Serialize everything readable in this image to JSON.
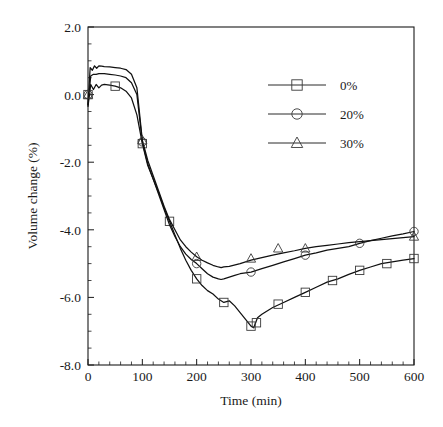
{
  "chart_data": {
    "type": "line",
    "title": "",
    "xlabel": "Time (min)",
    "ylabel": "Volume change (%)",
    "xlim": [
      0,
      600
    ],
    "ylim": [
      -8.0,
      2.0
    ],
    "xticks": [
      0,
      100,
      200,
      300,
      400,
      500,
      600
    ],
    "xtick_labels": [
      "0",
      "100",
      "200",
      "300",
      "400",
      "500",
      "600"
    ],
    "yticks": [
      2.0,
      0.0,
      -2.0,
      -4.0,
      -6.0,
      -8.0
    ],
    "ytick_labels": [
      "2.0",
      "0.0",
      "-2.0",
      "-4.0",
      "-6.0",
      "-8.0"
    ],
    "minor_ticks_x": 5,
    "minor_ticks_y": 4,
    "grid": false,
    "legend_position": "upper-right-inside",
    "series": [
      {
        "name": "0%",
        "marker": "square",
        "marker_x": [
          0,
          50,
          100,
          150,
          200,
          250,
          300,
          310,
          350,
          400,
          450,
          500,
          550,
          600
        ],
        "values_at_markers": [
          0.0,
          0.25,
          -1.45,
          -3.75,
          -5.45,
          -6.15,
          -6.85,
          -6.75,
          -6.2,
          -5.85,
          -5.5,
          -5.2,
          -5.0,
          -4.85
        ],
        "x": [
          0,
          5,
          10,
          15,
          20,
          25,
          30,
          40,
          50,
          60,
          70,
          80,
          90,
          100,
          110,
          120,
          130,
          140,
          150,
          160,
          170,
          180,
          190,
          200,
          210,
          220,
          230,
          240,
          250,
          260,
          270,
          280,
          290,
          300,
          305,
          312,
          320,
          340,
          360,
          380,
          400,
          420,
          440,
          460,
          480,
          500,
          520,
          540,
          560,
          580,
          600
        ],
        "y": [
          -0.35,
          0.3,
          0.15,
          0.3,
          0.2,
          0.28,
          0.3,
          0.28,
          0.25,
          0.2,
          0.1,
          -0.1,
          -0.6,
          -1.45,
          -2.1,
          -2.5,
          -2.9,
          -3.35,
          -3.75,
          -4.15,
          -4.55,
          -4.9,
          -5.2,
          -5.45,
          -5.65,
          -5.8,
          -5.9,
          -6.05,
          -6.15,
          -6.1,
          -6.25,
          -6.45,
          -6.65,
          -6.85,
          -6.9,
          -6.6,
          -6.5,
          -6.3,
          -6.15,
          -6.0,
          -5.85,
          -5.7,
          -5.55,
          -5.45,
          -5.32,
          -5.2,
          -5.1,
          -5.0,
          -4.95,
          -4.9,
          -4.85
        ]
      },
      {
        "name": "20%",
        "marker": "circle",
        "marker_x": [
          0,
          100,
          200,
          300,
          400,
          500,
          600
        ],
        "values_at_markers": [
          0.0,
          -1.4,
          -5.0,
          -5.25,
          -4.75,
          -4.4,
          -4.05
        ],
        "x": [
          0,
          5,
          10,
          15,
          20,
          30,
          40,
          50,
          60,
          70,
          80,
          90,
          100,
          110,
          120,
          130,
          140,
          150,
          160,
          170,
          180,
          190,
          200,
          210,
          220,
          230,
          240,
          245,
          250,
          260,
          270,
          280,
          300,
          320,
          340,
          360,
          380,
          400,
          420,
          440,
          460,
          480,
          500,
          520,
          540,
          560,
          580,
          600
        ],
        "y": [
          -0.3,
          0.55,
          0.6,
          0.6,
          0.62,
          0.62,
          0.6,
          0.58,
          0.55,
          0.5,
          0.35,
          0.0,
          -1.4,
          -2.05,
          -2.5,
          -2.95,
          -3.4,
          -3.85,
          -4.2,
          -4.5,
          -4.72,
          -4.88,
          -5.0,
          -5.15,
          -5.3,
          -5.4,
          -5.45,
          -5.47,
          -5.45,
          -5.4,
          -5.35,
          -5.3,
          -5.25,
          -5.15,
          -5.05,
          -4.95,
          -4.85,
          -4.75,
          -4.68,
          -4.6,
          -4.55,
          -4.5,
          -4.4,
          -4.32,
          -4.25,
          -4.18,
          -4.12,
          -4.05
        ]
      },
      {
        "name": "30%",
        "marker": "triangle",
        "marker_x": [
          0,
          100,
          200,
          300,
          350,
          400,
          600
        ],
        "values_at_markers": [
          0.0,
          -1.35,
          -4.8,
          -4.85,
          -4.55,
          -4.55,
          -4.2
        ],
        "x": [
          0,
          4,
          8,
          12,
          16,
          20,
          25,
          30,
          40,
          50,
          60,
          70,
          80,
          90,
          100,
          110,
          120,
          130,
          140,
          150,
          160,
          170,
          180,
          190,
          200,
          210,
          220,
          230,
          240,
          245,
          250,
          260,
          280,
          300,
          320,
          340,
          360,
          380,
          400,
          420,
          440,
          460,
          480,
          500,
          520,
          540,
          560,
          580,
          600
        ],
        "y": [
          -0.3,
          0.8,
          0.72,
          0.85,
          0.78,
          0.85,
          0.84,
          0.83,
          0.82,
          0.8,
          0.78,
          0.74,
          0.6,
          0.2,
          -1.35,
          -1.95,
          -2.4,
          -2.85,
          -3.3,
          -3.7,
          -4.0,
          -4.3,
          -4.5,
          -4.66,
          -4.8,
          -4.9,
          -4.98,
          -5.05,
          -5.1,
          -5.12,
          -5.1,
          -5.08,
          -5.0,
          -4.9,
          -4.82,
          -4.75,
          -4.68,
          -4.62,
          -4.55,
          -4.5,
          -4.46,
          -4.42,
          -4.38,
          -4.35,
          -4.32,
          -4.29,
          -4.26,
          -4.23,
          -4.2
        ]
      }
    ]
  },
  "legend": {
    "entries": [
      {
        "label": "0%",
        "marker": "square"
      },
      {
        "label": "20%",
        "marker": "circle"
      },
      {
        "label": "30%",
        "marker": "triangle"
      }
    ]
  }
}
